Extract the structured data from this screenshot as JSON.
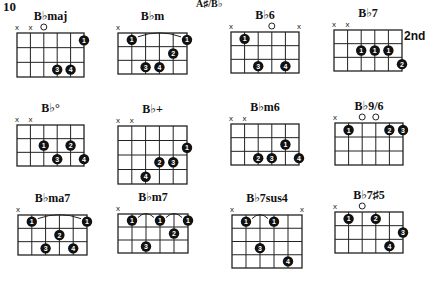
{
  "page": {
    "number": "10",
    "key": "A♯/B♭"
  },
  "strings": 6,
  "chords": [
    {
      "name": "B♭maj",
      "frets_shown": 3,
      "start_label": "",
      "markers": [
        "x",
        "x",
        "o",
        "",
        "",
        ""
      ],
      "dots": [
        {
          "s": 5,
          "f": 1,
          "n": "1"
        },
        {
          "s": 3,
          "f": 3,
          "n": "3"
        },
        {
          "s": 4,
          "f": 3,
          "n": "4"
        }
      ],
      "barres": []
    },
    {
      "name": "B♭m",
      "frets_shown": 3,
      "start_label": "",
      "markers": [
        "x",
        "",
        "",
        "",
        "",
        ""
      ],
      "dots": [
        {
          "s": 1,
          "f": 1,
          "n": "1"
        },
        {
          "s": 5,
          "f": 1,
          "n": "1"
        },
        {
          "s": 4,
          "f": 2,
          "n": "2"
        },
        {
          "s": 2,
          "f": 3,
          "n": "3"
        },
        {
          "s": 3,
          "f": 3,
          "n": "4"
        }
      ],
      "barres": [
        {
          "from": 1,
          "to": 5,
          "f": 1
        }
      ]
    },
    {
      "name": "B♭6",
      "frets_shown": 3,
      "start_label": "",
      "markers": [
        "x",
        "",
        "",
        "o",
        "",
        "x"
      ],
      "dots": [
        {
          "s": 1,
          "f": 1,
          "n": "1"
        },
        {
          "s": 2,
          "f": 3,
          "n": "3"
        },
        {
          "s": 4,
          "f": 3,
          "n": "4"
        }
      ],
      "barres": []
    },
    {
      "name": "B♭7",
      "frets_shown": 3,
      "start_label": "2nd",
      "markers": [
        "x",
        "x",
        "",
        "",
        "",
        ""
      ],
      "dots": [
        {
          "s": 2,
          "f": 2,
          "n": "1"
        },
        {
          "s": 3,
          "f": 2,
          "n": "1"
        },
        {
          "s": 4,
          "f": 2,
          "n": "1"
        },
        {
          "s": 5,
          "f": 3,
          "n": "2"
        }
      ],
      "barres": []
    },
    {
      "name": "B♭°",
      "frets_shown": 3,
      "start_label": "",
      "markers": [
        "x",
        "x",
        "",
        "",
        "",
        ""
      ],
      "dots": [
        {
          "s": 2,
          "f": 2,
          "n": "1"
        },
        {
          "s": 4,
          "f": 2,
          "n": "2"
        },
        {
          "s": 3,
          "f": 3,
          "n": "3"
        },
        {
          "s": 5,
          "f": 3,
          "n": "4"
        }
      ],
      "barres": []
    },
    {
      "name": "B♭+",
      "frets_shown": 4,
      "start_label": "",
      "markers": [
        "x",
        "x",
        "",
        "",
        "",
        ""
      ],
      "dots": [
        {
          "s": 5,
          "f": 2,
          "n": "1"
        },
        {
          "s": 3,
          "f": 3,
          "n": "2"
        },
        {
          "s": 4,
          "f": 3,
          "n": "3"
        },
        {
          "s": 2,
          "f": 4,
          "n": "4"
        }
      ],
      "barres": []
    },
    {
      "name": "B♭m6",
      "frets_shown": 3,
      "start_label": "",
      "markers": [
        "x",
        "x",
        "",
        "",
        "",
        ""
      ],
      "dots": [
        {
          "s": 4,
          "f": 2,
          "n": "1"
        },
        {
          "s": 2,
          "f": 3,
          "n": "2"
        },
        {
          "s": 3,
          "f": 3,
          "n": "3"
        },
        {
          "s": 5,
          "f": 3,
          "n": "4"
        }
      ],
      "barres": []
    },
    {
      "name": "B♭9/6",
      "frets_shown": 3,
      "start_label": "",
      "markers": [
        "x",
        "",
        "o",
        "o",
        "",
        ""
      ],
      "dots": [
        {
          "s": 1,
          "f": 1,
          "n": "1"
        },
        {
          "s": 4,
          "f": 1,
          "n": "2"
        },
        {
          "s": 5,
          "f": 1,
          "n": "3"
        }
      ],
      "barres": []
    },
    {
      "name": "B♭ma7",
      "frets_shown": 3,
      "start_label": "",
      "markers": [
        "x",
        "",
        "",
        "",
        "",
        ""
      ],
      "dots": [
        {
          "s": 1,
          "f": 1,
          "n": "1"
        },
        {
          "s": 5,
          "f": 1,
          "n": "1"
        },
        {
          "s": 3,
          "f": 2,
          "n": "2"
        },
        {
          "s": 2,
          "f": 3,
          "n": "3"
        },
        {
          "s": 4,
          "f": 3,
          "n": "4"
        }
      ],
      "barres": [
        {
          "from": 1,
          "to": 5,
          "f": 1
        }
      ]
    },
    {
      "name": "B♭m7",
      "frets_shown": 3,
      "start_label": "",
      "markers": [
        "x",
        "",
        "",
        "",
        "",
        ""
      ],
      "dots": [
        {
          "s": 1,
          "f": 1,
          "n": "1"
        },
        {
          "s": 3,
          "f": 1,
          "n": "1"
        },
        {
          "s": 5,
          "f": 1,
          "n": "1"
        },
        {
          "s": 4,
          "f": 2,
          "n": "2"
        },
        {
          "s": 2,
          "f": 3,
          "n": "3"
        }
      ],
      "barres": [
        {
          "from": 1,
          "to": 3,
          "f": 1
        },
        {
          "from": 3,
          "to": 5,
          "f": 1
        }
      ]
    },
    {
      "name": "B♭7sus4",
      "frets_shown": 4,
      "start_label": "",
      "markers": [
        "x",
        "",
        "",
        "",
        "",
        "x"
      ],
      "dots": [
        {
          "s": 1,
          "f": 1,
          "n": "1"
        },
        {
          "s": 3,
          "f": 1,
          "n": "1"
        },
        {
          "s": 2,
          "f": 3,
          "n": "3"
        },
        {
          "s": 4,
          "f": 4,
          "n": "4"
        }
      ],
      "barres": [
        {
          "from": 1,
          "to": 3,
          "f": 1
        }
      ]
    },
    {
      "name": "B♭7♯5",
      "frets_shown": 3,
      "start_label": "",
      "markers": [
        "x",
        "",
        "o",
        "",
        "",
        ""
      ],
      "dots": [
        {
          "s": 1,
          "f": 1,
          "n": "1"
        },
        {
          "s": 3,
          "f": 1,
          "n": "2"
        },
        {
          "s": 5,
          "f": 2,
          "n": "3"
        },
        {
          "s": 4,
          "f": 3,
          "n": "4"
        }
      ],
      "barres": []
    }
  ]
}
